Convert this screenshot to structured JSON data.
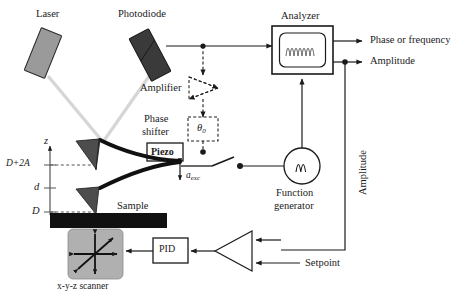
{
  "figure": {
    "background_color": "#ffffff",
    "line_color": "#1a1a1a",
    "beam_color": "#d4d4d4",
    "laser_color": "#9a9a9a",
    "photodiode_color": "#3a3a3a",
    "scanner_color": "#b0b0b0",
    "sample_color": "#111111"
  },
  "labels": {
    "laser": "Laser",
    "photodiode": "Photodiode",
    "analyzer": "Analyzer",
    "amplifier": "Amplifier",
    "phase_shifter_line1": "Phase",
    "phase_shifter_line2": "shifter",
    "phase_shifter_symbol": "θ0",
    "piezo": "Piezo",
    "function_generator_line1": "Function",
    "function_generator_line2": "generator",
    "sample": "Sample",
    "scanner": "x-y-z scanner",
    "pid": "PID",
    "setpoint": "Setpoint",
    "output_phase": "Phase or frequency",
    "output_amplitude": "Amplitude",
    "feedback_amplitude": "Amplitude",
    "axis_z": "z",
    "axis_d_plus_2a": "D+2A",
    "axis_d_small": "d",
    "axis_d_cap": "D",
    "a_exc_base": "a",
    "a_exc_sub": "exc",
    "theta_base": "θ",
    "theta_sub": "0"
  },
  "components": [
    {
      "name": "laser",
      "type": "tilted-rect",
      "fill": "#9a9a9a"
    },
    {
      "name": "photodiode",
      "type": "tilted-rect",
      "fill": "#3a3a3a"
    },
    {
      "name": "analyzer",
      "type": "rect-with-screen"
    },
    {
      "name": "amplifier",
      "type": "dashed-triangle"
    },
    {
      "name": "phase-shifter",
      "type": "dashed-rect"
    },
    {
      "name": "piezo",
      "type": "rect"
    },
    {
      "name": "function-generator",
      "type": "circle-with-wave"
    },
    {
      "name": "cantilever-upper",
      "type": "curved-beam-with-tip"
    },
    {
      "name": "cantilever-lower",
      "type": "curved-beam-with-tip"
    },
    {
      "name": "sample",
      "type": "filled-bar"
    },
    {
      "name": "xyz-scanner",
      "type": "rounded-square-with-arrows"
    },
    {
      "name": "pid",
      "type": "rect"
    },
    {
      "name": "comparator",
      "type": "triangle"
    },
    {
      "name": "switch",
      "type": "toggle-switch"
    }
  ]
}
